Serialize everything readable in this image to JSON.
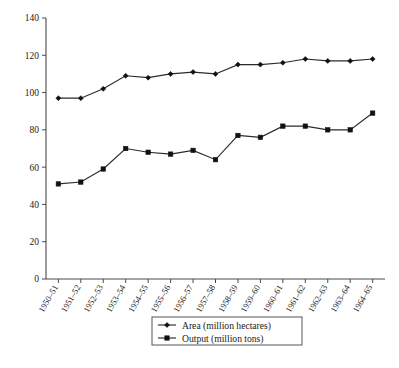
{
  "chart_data": {
    "type": "line",
    "title": "",
    "xlabel": "",
    "ylabel": "",
    "ylim": [
      0,
      140
    ],
    "ytick_step": 20,
    "yticks": [
      0,
      20,
      40,
      60,
      80,
      100,
      120,
      140
    ],
    "grid": false,
    "legend_position": "bottom-center",
    "categories": [
      "1950–51",
      "1951–52",
      "1952–53",
      "1953–54",
      "1954–55",
      "1955–56",
      "1956–57",
      "1957–58",
      "1958–59",
      "1959–60",
      "1960–61",
      "1961–62",
      "1962–63",
      "1963–64",
      "1964–65"
    ],
    "series": [
      {
        "name": "Area (million hectares)",
        "marker": "diamond",
        "color": "#111111",
        "values": [
          97,
          97,
          102,
          109,
          108,
          110,
          111,
          110,
          115,
          115,
          116,
          118,
          117,
          117,
          118
        ]
      },
      {
        "name": "Output (million tons)",
        "marker": "square",
        "color": "#111111",
        "values": [
          51,
          52,
          59,
          70,
          68,
          67,
          69,
          64,
          77,
          76,
          82,
          82,
          80,
          80,
          89
        ]
      }
    ]
  },
  "legend": {
    "entries": [
      {
        "label": "Area (million hectares)",
        "marker": "diamond-marker"
      },
      {
        "label": "Output (million tons)",
        "marker": "square-marker"
      }
    ]
  },
  "axes": {
    "y_axis_name": "y-axis",
    "x_axis_name": "x-axis"
  }
}
